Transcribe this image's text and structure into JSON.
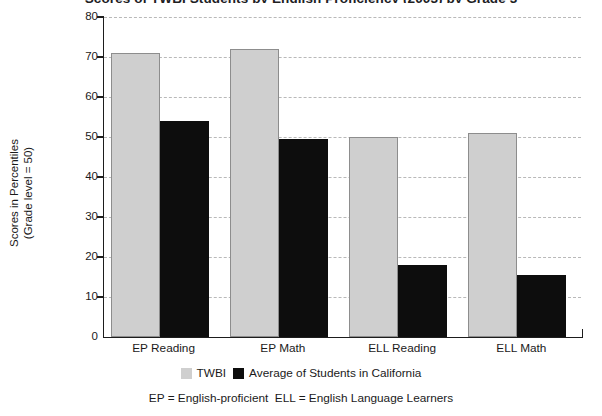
{
  "chart_data": {
    "type": "bar",
    "title": "Scores of TWBI Students by English Proficiency (2003) by Grade 3",
    "categories": [
      "EP Reading",
      "EP Math",
      "ELL Reading",
      "ELL Math"
    ],
    "series": [
      {
        "name": "TWBI",
        "color": "#cfcfcf",
        "values": [
          71,
          72,
          50,
          51
        ]
      },
      {
        "name": "Average of Students in California",
        "color": "#0d0d0d",
        "values": [
          54,
          49.5,
          18,
          15.5
        ]
      }
    ],
    "xlabel": "",
    "ylabel_line1": "Scores in Percentiles",
    "ylabel_line2": "(Grade level = 50)",
    "ylim": [
      0,
      80
    ],
    "ytick_step": 10,
    "yticks": [
      "80",
      "70",
      "60",
      "50",
      "40",
      "30",
      "20",
      "10",
      "0"
    ],
    "grid": true,
    "legend_position": "bottom",
    "footnote": "EP = English-proficient  ELL = English Language Learners"
  }
}
